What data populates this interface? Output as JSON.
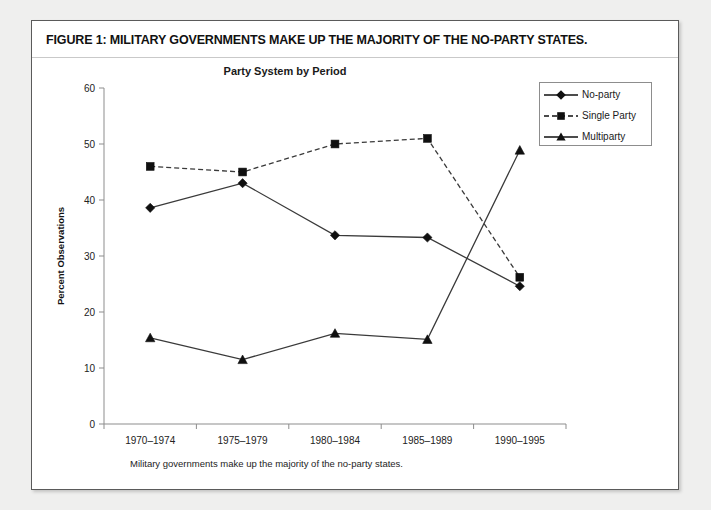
{
  "figure": {
    "title": "FIGURE 1: MILITARY GOVERNMENTS MAKE UP THE MAJORITY OF THE NO-PARTY STATES.",
    "caption": "Military governments make up the majority of the no-party states."
  },
  "legend": {
    "position": "top-right",
    "items": [
      {
        "label": "No-party",
        "marker": "diamond",
        "line": "solid"
      },
      {
        "label": "Single Party",
        "marker": "square",
        "line": "dashed"
      },
      {
        "label": "Multiparty",
        "marker": "triangle",
        "line": "solid"
      }
    ]
  },
  "chart_data": {
    "type": "line",
    "title": "Party System by Period",
    "xlabel": "",
    "ylabel": "Percent Observations",
    "categories": [
      "1970–1974",
      "1975–1979",
      "1980–1984",
      "1985–1989",
      "1990–1995"
    ],
    "ylim": [
      0,
      60
    ],
    "yticks": [
      0,
      10,
      20,
      30,
      40,
      50,
      60
    ],
    "ytick_labels": [
      "0",
      "10",
      "20",
      "30",
      "40",
      "50",
      "60"
    ],
    "grid": false,
    "series": [
      {
        "name": "No-party",
        "marker": "diamond",
        "line": "solid",
        "color": "#101010",
        "values": [
          38.6,
          43.0,
          33.7,
          33.3,
          24.6
        ]
      },
      {
        "name": "Single Party",
        "marker": "square",
        "line": "dashed",
        "color": "#101010",
        "values": [
          46.0,
          45.0,
          50.0,
          51.0,
          26.2
        ]
      },
      {
        "name": "Multiparty",
        "marker": "triangle",
        "line": "solid",
        "color": "#101010",
        "values": [
          15.4,
          11.5,
          16.2,
          15.1,
          48.9
        ]
      }
    ]
  },
  "colors": {
    "page_background": "#efefee",
    "figure_background": "#ffffff",
    "figure_border": "#5a5a5a",
    "axis": "#8d8d8d",
    "series": "#101010"
  }
}
